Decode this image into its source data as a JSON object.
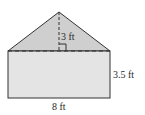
{
  "figure": {
    "shape": "rectangle topped by isosceles triangle",
    "triangle_height_label": "3 ft",
    "rectangle_height_label": "3.5 ft",
    "base_width_label": "8 ft",
    "colors": {
      "triangle_fill": "#cfcfcf",
      "rectangle_fill": "#e4e4e4",
      "stroke": "#333333"
    }
  }
}
